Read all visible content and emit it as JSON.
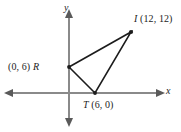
{
  "figure": {
    "axes": {
      "x_label": "x",
      "y_label": "y",
      "origin_px": [
        69,
        93
      ],
      "x_axis_from_px": [
        6,
        93
      ],
      "x_axis_to_px": [
        163,
        93
      ],
      "y_axis_from_px": [
        69,
        10
      ],
      "y_axis_to_px": [
        69,
        126
      ],
      "arrowheads": [
        "left",
        "right",
        "up",
        "down"
      ],
      "axis_color": "#8a8a8a",
      "grid": false,
      "tick_labels": []
    },
    "shape": {
      "name": "triangle",
      "stroke_color": "#1c1c1c",
      "vertices": [
        {
          "id": "R",
          "letter": "R",
          "coords_text": "(0, 6)",
          "full_label": "(0, 6) R",
          "x": 0,
          "y": 6,
          "px": [
            69,
            67
          ],
          "marker": true
        },
        {
          "id": "I",
          "letter": "I",
          "coords_text": "(12, 12)",
          "full_label": "I (12, 12)",
          "x": 12,
          "y": 12,
          "px": [
            131,
            32
          ],
          "marker": true
        },
        {
          "id": "T",
          "letter": "T",
          "coords_text": "(6, 0)",
          "full_label": "T (6, 0)",
          "x": 6,
          "y": 0,
          "px": [
            95,
            93
          ],
          "marker": true
        }
      ],
      "edges": [
        {
          "from": "R",
          "to": "I"
        },
        {
          "from": "I",
          "to": "T"
        },
        {
          "from": "T",
          "to": "R"
        }
      ]
    },
    "labels": {
      "I_letter": "I",
      "I_coords": "(12, 12)",
      "R_letter": "R",
      "R_coords": "(0, 6)",
      "T_letter": "T",
      "T_coords": "(6, 0)"
    }
  }
}
